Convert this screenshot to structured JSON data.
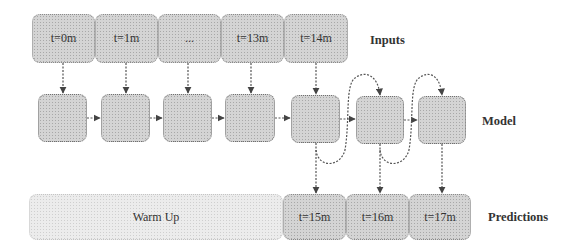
{
  "diagram": {
    "row_labels": {
      "inputs": "Inputs",
      "model": "Model",
      "predictions": "Predictions"
    },
    "inputs": [
      "t=0m",
      "t=1m",
      "...",
      "t=13m",
      "t=14m"
    ],
    "model_cells": 7,
    "warm_up": "Warm Up",
    "predictions": [
      "t=15m",
      "t=16m",
      "t=17m"
    ],
    "colors": {
      "box_fill": "#d4d4d4",
      "warmup_fill": "#ececec",
      "line": "#555555"
    }
  }
}
